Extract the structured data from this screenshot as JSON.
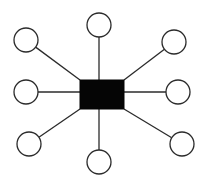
{
  "diagram": {
    "type": "star-topology",
    "canvas": {
      "width": 205,
      "height": 185,
      "background": "#ffffff"
    },
    "colors": {
      "line": "#2b2b2b",
      "hub_fill": "#050505",
      "node_fill": "#ffffff"
    },
    "hub": {
      "shape": "rectangle",
      "x": 80,
      "y": 80,
      "width": 44,
      "height": 29,
      "label": ""
    },
    "nodes": [
      {
        "id": "top",
        "cx": 99,
        "cy": 25,
        "r": 12,
        "label": "",
        "anchor_x": 99,
        "anchor_y": 80
      },
      {
        "id": "top-left",
        "cx": 26,
        "cy": 40,
        "r": 12,
        "label": "",
        "anchor_x": 80,
        "anchor_y": 80
      },
      {
        "id": "top-right",
        "cx": 174,
        "cy": 42,
        "r": 12,
        "label": "",
        "anchor_x": 124,
        "anchor_y": 80
      },
      {
        "id": "left",
        "cx": 26,
        "cy": 92,
        "r": 12,
        "label": "",
        "anchor_x": 80,
        "anchor_y": 92
      },
      {
        "id": "right",
        "cx": 178,
        "cy": 92,
        "r": 12,
        "label": "",
        "anchor_x": 124,
        "anchor_y": 92
      },
      {
        "id": "bottom-left",
        "cx": 29,
        "cy": 144,
        "r": 12,
        "label": "",
        "anchor_x": 80,
        "anchor_y": 109
      },
      {
        "id": "bottom",
        "cx": 99,
        "cy": 162,
        "r": 12,
        "label": "",
        "anchor_x": 99,
        "anchor_y": 109
      },
      {
        "id": "bottom-right",
        "cx": 182,
        "cy": 144,
        "r": 12,
        "label": "",
        "anchor_x": 124,
        "anchor_y": 109
      }
    ]
  }
}
